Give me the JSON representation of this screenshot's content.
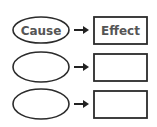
{
  "diagram": {
    "type": "cause-effect-organizer",
    "rows": [
      {
        "cause": "Cause",
        "effect": "Effect"
      },
      {
        "cause": "",
        "effect": ""
      },
      {
        "cause": "",
        "effect": ""
      }
    ],
    "colors": {
      "stroke": "#2b2b2b",
      "text": "#555555",
      "background": "#ffffff"
    }
  }
}
